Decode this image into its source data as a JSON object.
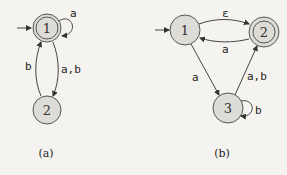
{
  "diagrams": [
    {
      "caption": "(a)",
      "states": [
        {
          "id": "1",
          "label": "1",
          "start": true,
          "accepting": true
        },
        {
          "id": "2",
          "label": "2",
          "start": false,
          "accepting": false
        }
      ],
      "transitions": [
        {
          "from": "1",
          "to": "1",
          "label": "a"
        },
        {
          "from": "1",
          "to": "2",
          "label": "a,b"
        },
        {
          "from": "2",
          "to": "1",
          "label": "b"
        }
      ]
    },
    {
      "caption": "(b)",
      "states": [
        {
          "id": "1",
          "label": "1",
          "start": true,
          "accepting": false
        },
        {
          "id": "2",
          "label": "2",
          "start": false,
          "accepting": true
        },
        {
          "id": "3",
          "label": "3",
          "start": false,
          "accepting": false
        }
      ],
      "transitions": [
        {
          "from": "1",
          "to": "2",
          "label": "ε"
        },
        {
          "from": "2",
          "to": "1",
          "label": "a"
        },
        {
          "from": "1",
          "to": "3",
          "label": "a"
        },
        {
          "from": "3",
          "to": "2",
          "label": "a,b"
        },
        {
          "from": "3",
          "to": "3",
          "label": "b"
        }
      ]
    }
  ]
}
